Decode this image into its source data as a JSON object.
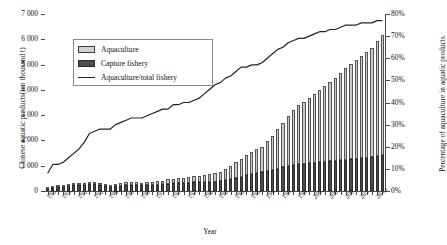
{
  "chart_data": {
    "type": "bar",
    "title": "",
    "xlabel": "Year",
    "ylabel": "Chinese aquatic products(ten thousand t)",
    "y2label": "Percentage of aquaculture in aquatic products",
    "ylim": [
      0,
      7000
    ],
    "y2lim": [
      0,
      0.8
    ],
    "grid": false,
    "legend_position": "upper-left-inside",
    "y_ticks": [
      0,
      1000,
      2000,
      3000,
      4000,
      5000,
      6000,
      7000
    ],
    "y_tick_labels": [
      "0",
      "1 000",
      "2 000",
      "3 000",
      "4 000",
      "5 000",
      "6 000",
      "7 000"
    ],
    "y2_ticks": [
      0,
      10,
      20,
      30,
      40,
      50,
      60,
      70,
      80
    ],
    "y2_tick_labels": [
      "0%",
      "10%",
      "20%",
      "30%",
      "40%",
      "50%",
      "60%",
      "70%",
      "80%"
    ],
    "x_tick_labels": [
      "1950",
      "1953",
      "1956",
      "1959",
      "1962",
      "1965",
      "1968",
      "1971",
      "1974",
      "1977",
      "1980",
      "1983",
      "1986",
      "1989",
      "1992",
      "1995",
      "1998",
      "2001",
      "2004",
      "2007",
      "2010",
      "2013"
    ],
    "legend": [
      "Aquaculture",
      "Capture fishery",
      "Aquaculture/total fishery"
    ],
    "colors": {
      "aquaculture": "#c9c9c9",
      "capture": "#4d4d4d",
      "line": "#222222",
      "axis": "#4a4a4a"
    },
    "categories": [
      1950,
      1951,
      1952,
      1953,
      1954,
      1955,
      1956,
      1957,
      1958,
      1959,
      1960,
      1961,
      1962,
      1963,
      1964,
      1965,
      1966,
      1967,
      1968,
      1969,
      1970,
      1971,
      1972,
      1973,
      1974,
      1975,
      1976,
      1977,
      1978,
      1979,
      1980,
      1981,
      1982,
      1983,
      1984,
      1985,
      1986,
      1987,
      1988,
      1989,
      1990,
      1991,
      1992,
      1993,
      1994,
      1995,
      1996,
      1997,
      1998,
      1999,
      2000,
      2001,
      2002,
      2003,
      2004,
      2005,
      2006,
      2007,
      2008,
      2009,
      2010,
      2011,
      2012,
      2013,
      2014
    ],
    "series": [
      {
        "name": "Capture fishery",
        "stack": "production",
        "values": [
          80,
          100,
          140,
          170,
          200,
          220,
          230,
          250,
          260,
          260,
          220,
          180,
          170,
          190,
          210,
          230,
          240,
          230,
          220,
          230,
          240,
          250,
          260,
          290,
          300,
          310,
          320,
          330,
          346,
          350,
          354,
          368,
          372,
          390,
          430,
          480,
          520,
          560,
          620,
          660,
          710,
          740,
          790,
          830,
          880,
          930,
          980,
          1020,
          1060,
          1080,
          1100,
          1120,
          1140,
          1160,
          1180,
          1200,
          1210,
          1230,
          1250,
          1280,
          1300,
          1320,
          1350,
          1390,
          1420
        ]
      },
      {
        "name": "Aquaculture",
        "stack": "production",
        "values": [
          10,
          15,
          20,
          25,
          35,
          45,
          55,
          70,
          90,
          95,
          85,
          70,
          65,
          80,
          95,
          110,
          120,
          115,
          110,
          120,
          130,
          140,
          150,
          170,
          190,
          200,
          210,
          220,
          237,
          250,
          280,
          310,
          340,
          380,
          440,
          520,
          610,
          700,
          800,
          880,
          950,
          1020,
          1180,
          1350,
          1560,
          1760,
          1990,
          2180,
          2330,
          2450,
          2580,
          2720,
          2860,
          2980,
          3130,
          3280,
          3450,
          3620,
          3760,
          3890,
          4030,
          4170,
          4320,
          4540,
          4750
        ]
      }
    ],
    "line_series": {
      "name": "Aquaculture/total fishery",
      "axis": "right",
      "unit": "%",
      "values": [
        8,
        12,
        12,
        13,
        15,
        17,
        19,
        22,
        26,
        27,
        28,
        28,
        28,
        30,
        31,
        32,
        33,
        33,
        33,
        34,
        35,
        36,
        37,
        37,
        39,
        39,
        40,
        40,
        41,
        42,
        44,
        46,
        48,
        49,
        51,
        52,
        54,
        56,
        56,
        57,
        57,
        58,
        60,
        62,
        64,
        65,
        67,
        68,
        69,
        69,
        70,
        71,
        72,
        72,
        73,
        73,
        74,
        75,
        75,
        75,
        76,
        76,
        76,
        77,
        77
      ]
    },
    "line_values_display": [
      8,
      12,
      12,
      13,
      15,
      17,
      19,
      22,
      26,
      27,
      28,
      28,
      28,
      30,
      31,
      32,
      33,
      33,
      33,
      34,
      35,
      36,
      37,
      37,
      39,
      39,
      40,
      40,
      41,
      42,
      44,
      46,
      48,
      49,
      51,
      52,
      54,
      56,
      56,
      57,
      57,
      58,
      60,
      62,
      64,
      65,
      67,
      68,
      69,
      69,
      70,
      71,
      72,
      72,
      73,
      73,
      74,
      75,
      75,
      75,
      76,
      76,
      76,
      77,
      77
    ]
  }
}
